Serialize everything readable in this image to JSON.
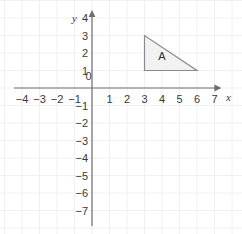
{
  "figure": {
    "kind": "coordinate-plane",
    "background_color": "#ffffff",
    "grid_color": "#f0f0f0",
    "axis_color": "#6e6e6e",
    "label_color": "#3a3a3a"
  },
  "axes": {
    "x_axis_name": "x",
    "y_axis_name": "y",
    "x_labels": [
      "−4",
      "−3",
      "−2",
      "−1",
      "0",
      "1",
      "2",
      "3",
      "4",
      "5",
      "6",
      "7"
    ],
    "x_values": [
      -4,
      -3,
      -2,
      -1,
      0,
      1,
      2,
      3,
      4,
      5,
      6,
      7
    ],
    "y_labels": [
      "4",
      "3",
      "2",
      "1",
      "0",
      "−1",
      "−2",
      "−3",
      "−4",
      "−5",
      "−6",
      "−7"
    ],
    "y_values": [
      4,
      3,
      2,
      1,
      0,
      -1,
      -2,
      -3,
      -4,
      -5,
      -6,
      -7
    ],
    "xlim": [
      -4.6,
      7.6
    ],
    "ylim": [
      -7.6,
      4.4
    ],
    "origin_label": "0",
    "x_arrow": true,
    "y_arrow": true
  },
  "chart_data": {
    "type": "scatter",
    "title": "",
    "xlabel": "x",
    "ylabel": "y",
    "xlim": [
      -4.6,
      7.6
    ],
    "ylim": [
      -7.6,
      4.4
    ],
    "grid": true,
    "legend": "none",
    "shapes": [
      {
        "name": "A",
        "label": "A",
        "type": "right-triangle",
        "vertices": [
          [
            3,
            3
          ],
          [
            3,
            1
          ],
          [
            6,
            1
          ]
        ],
        "label_position": [
          4.0,
          1.85
        ],
        "fill": "#f2f2f2",
        "stroke": "#8a8a8a"
      }
    ]
  }
}
